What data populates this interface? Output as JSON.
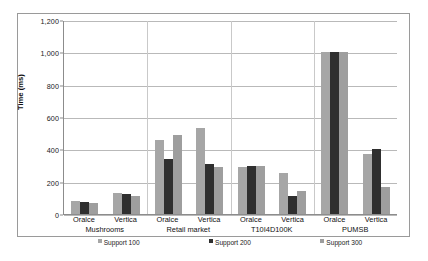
{
  "chart_data": {
    "type": "bar",
    "title": "",
    "xlabel": "",
    "ylabel": "Time (ms)",
    "ylim": [
      0,
      1200
    ],
    "ytick_labels": [
      "1,200",
      "1,000",
      "800",
      "600",
      "400",
      "200",
      "0"
    ],
    "ytick_values": [
      1200,
      1000,
      800,
      600,
      400,
      200,
      0
    ],
    "grid": true,
    "legend_position": "bottom",
    "categories": [
      "Oralce / Mushrooms",
      "Vertica / Mushrooms",
      "Oralce / Retail market",
      "Vertica / Retail market",
      "Oralce / T10I4D100K",
      "Vertica / T10I4D100K",
      "Oralce / PUMSB",
      "Vertica / PUMSB"
    ],
    "groups": [
      {
        "dataset": "Mushrooms",
        "systems": [
          {
            "name": "Oralce",
            "values": [
              80,
              75,
              70
            ]
          },
          {
            "name": "Vertica",
            "values": [
              130,
              125,
              110
            ]
          }
        ]
      },
      {
        "dataset": "Retail market",
        "systems": [
          {
            "name": "Oralce",
            "values": [
              460,
              340,
              490
            ]
          },
          {
            "name": "Vertica",
            "values": [
              535,
              310,
              290
            ]
          }
        ]
      },
      {
        "dataset": "T10I4D100K",
        "systems": [
          {
            "name": "Oralce",
            "values": [
              290,
              300,
              295
            ]
          },
          {
            "name": "Vertica",
            "values": [
              255,
              110,
              145
            ]
          }
        ]
      },
      {
        "dataset": "PUMSB",
        "systems": [
          {
            "name": "Oralce",
            "values": [
              1000,
              1000,
              1000
            ]
          },
          {
            "name": "Vertica",
            "values": [
              370,
              400,
              170
            ]
          }
        ]
      }
    ],
    "series": [
      {
        "name": "Support 100",
        "color": "#a6a6a6",
        "values": [
          80,
          130,
          460,
          535,
          290,
          255,
          1000,
          370
        ]
      },
      {
        "name": "Support 200",
        "color": "#2f2f2f",
        "values": [
          75,
          125,
          340,
          310,
          300,
          110,
          1000,
          400
        ]
      },
      {
        "name": "Support 300",
        "color": "#9e9e9e",
        "values": [
          70,
          110,
          490,
          290,
          295,
          145,
          1000,
          170
        ]
      }
    ]
  },
  "legend": {
    "items": [
      {
        "label": "Support 100",
        "marker": "legend-swatch-support-100"
      },
      {
        "label": "Support 200",
        "marker": "legend-swatch-support-200"
      },
      {
        "label": "Support 300",
        "marker": "legend-swatch-support-300"
      }
    ]
  },
  "caption": {
    "text": ""
  }
}
